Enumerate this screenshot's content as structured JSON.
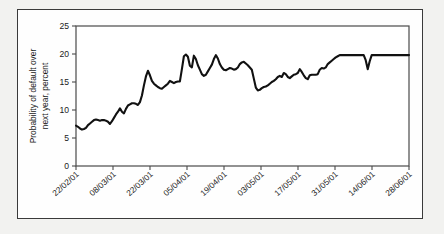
{
  "figure": {
    "background_color": "#f2f2f0",
    "panel_color": "#fefefe",
    "frame_color": "#3a3a3a",
    "line_color": "#111111",
    "axis_color": "#4a4a4a"
  },
  "chart_data": {
    "type": "line",
    "title": "",
    "xlabel": "",
    "ylabel": "Probability of default over next year, percent",
    "ylabel_lines": [
      "Probability of default over",
      "next year, percent"
    ],
    "ylim": [
      0,
      25
    ],
    "yticks": [
      0,
      5,
      10,
      15,
      20,
      25
    ],
    "ytick_labels": [
      "0",
      "5",
      "10",
      "15",
      "20",
      "25"
    ],
    "xtick_labels": [
      "22/02/01",
      "08/03/01",
      "22/03/01",
      "05/04/01",
      "19/04/01",
      "03/05/01",
      "17/05/01",
      "31/05/01",
      "14/06/01",
      "28/06/01"
    ],
    "x_start_label": "22/02/01",
    "x_end_label": "28/06/01",
    "grid": false,
    "legend": null,
    "series": [
      {
        "name": "Probability of default over next year",
        "units": "percent",
        "x": [
          0.0,
          0.6,
          1.2,
          1.8,
          2.4,
          3.0,
          3.6,
          4.2,
          4.8,
          5.4,
          6.0,
          6.6,
          7.2,
          7.8,
          8.4,
          9.0,
          9.6,
          10.2,
          10.8,
          11.4,
          12.0,
          12.6,
          13.2,
          13.8,
          14.4,
          15.0,
          15.6,
          16.2,
          16.8,
          17.4,
          18.0,
          18.6,
          19.2,
          19.8,
          20.4,
          21.0,
          21.6,
          22.2,
          22.8,
          23.4,
          24.0,
          24.6,
          25.2,
          25.8,
          26.4,
          27.0,
          27.6,
          28.2,
          28.8,
          29.4,
          30.0,
          30.6,
          31.2,
          31.8,
          32.4,
          33.0,
          33.6,
          34.2,
          34.8,
          35.4,
          36.0,
          36.6,
          37.2,
          37.8,
          38.4,
          39.0,
          39.6,
          40.2,
          40.8,
          41.4,
          42.0,
          42.6,
          43.2,
          43.8,
          44.4,
          45.0,
          45.6,
          46.2,
          46.8,
          47.4,
          48.0,
          48.6,
          49.2,
          49.8,
          50.4,
          51.0,
          51.6,
          52.2,
          52.8,
          53.4,
          54.0,
          54.6,
          55.2,
          55.8,
          56.4,
          57.0,
          57.6,
          58.2,
          58.8,
          59.4,
          60.0,
          60.6,
          61.2,
          61.8,
          62.4,
          63.0,
          63.6,
          64.2,
          64.8,
          65.4,
          66.0,
          66.6,
          67.2,
          67.8,
          68.4,
          69.0,
          69.6,
          70.2,
          70.8,
          71.4,
          72.0,
          72.6,
          73.2,
          73.8,
          74.4,
          75.0,
          75.6,
          76.2,
          76.8,
          77.4,
          78.0,
          78.6,
          79.2,
          79.8,
          80.4,
          81.0,
          81.6,
          82.2,
          82.8,
          83.4,
          84.0,
          84.6,
          85.2,
          85.8,
          86.4,
          87.0,
          87.6,
          88.2,
          88.8,
          89.4,
          90.0,
          90.6,
          91.2,
          91.8,
          92.4,
          93.0,
          93.6,
          94.2,
          94.8,
          95.4,
          96.0,
          96.6,
          97.2,
          97.8,
          98.4,
          99.0,
          99.6,
          100.0
        ],
        "y": [
          7.2,
          7.0,
          6.7,
          6.5,
          6.6,
          6.8,
          7.3,
          7.6,
          7.9,
          8.2,
          8.3,
          8.2,
          8.1,
          8.2,
          8.2,
          8.1,
          7.9,
          7.5,
          8.0,
          8.6,
          9.2,
          9.7,
          10.3,
          9.7,
          9.4,
          10.2,
          10.8,
          11.0,
          11.2,
          11.2,
          11.1,
          10.9,
          11.4,
          12.6,
          14.4,
          16.0,
          17.0,
          16.2,
          15.2,
          14.7,
          14.4,
          14.1,
          13.9,
          13.8,
          14.1,
          14.4,
          14.7,
          15.2,
          15.0,
          14.8,
          15.0,
          15.1,
          15.1,
          17.3,
          19.6,
          19.9,
          19.5,
          17.9,
          17.6,
          19.7,
          19.1,
          18.0,
          17.2,
          16.4,
          16.1,
          16.3,
          16.9,
          17.5,
          18.1,
          19.1,
          19.8,
          19.2,
          18.2,
          17.6,
          17.2,
          17.1,
          17.3,
          17.5,
          17.4,
          17.2,
          17.3,
          17.6,
          18.2,
          18.5,
          18.6,
          18.3,
          18.0,
          17.6,
          17.2,
          15.6,
          14.0,
          13.5,
          13.6,
          13.9,
          14.1,
          14.2,
          14.4,
          14.7,
          15.0,
          15.2,
          15.5,
          15.9,
          16.1,
          15.9,
          16.6,
          16.4,
          15.9,
          15.7,
          16.0,
          16.3,
          16.4,
          16.6,
          17.3,
          16.8,
          16.2,
          15.7,
          15.5,
          16.2,
          16.3,
          16.3,
          16.3,
          16.4,
          17.2,
          17.5,
          17.4,
          17.6,
          18.2,
          18.5,
          18.8,
          19.1,
          19.4,
          19.6,
          19.8,
          19.8,
          19.8,
          19.8,
          19.8,
          19.8,
          19.8,
          19.8,
          19.8,
          19.8,
          19.8,
          19.8,
          19.8,
          18.9,
          17.3,
          18.7,
          19.8,
          19.8,
          19.8,
          19.8,
          19.8,
          19.8,
          19.8,
          19.8,
          19.8,
          19.8,
          19.8,
          19.8,
          19.8,
          19.8,
          19.8,
          19.8,
          19.8,
          19.8,
          19.8,
          19.8
        ]
      }
    ]
  }
}
